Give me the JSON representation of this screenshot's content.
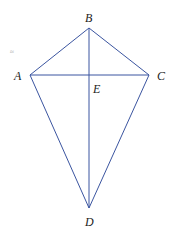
{
  "diagram": {
    "type": "kite",
    "stroke_color": "#3b55a0",
    "points": {
      "A": {
        "label": "A",
        "x": 30,
        "y": 75
      },
      "B": {
        "label": "B",
        "x": 89,
        "y": 28
      },
      "C": {
        "label": "C",
        "x": 149,
        "y": 75
      },
      "D": {
        "label": "D",
        "x": 89,
        "y": 208
      },
      "E": {
        "label": "E",
        "x": 89,
        "y": 75
      }
    },
    "segments": [
      "AB",
      "BC",
      "CD",
      "DA",
      "AC",
      "BD"
    ],
    "stray_mark": "≈"
  }
}
